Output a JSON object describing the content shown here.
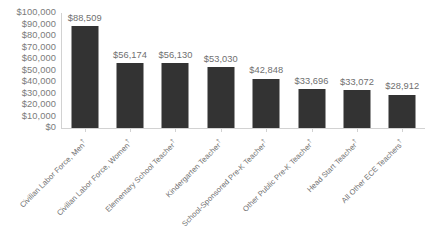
{
  "chart_data": {
    "type": "bar",
    "title": "",
    "subtitle": "",
    "xlabel": "",
    "ylabel": "",
    "ylim": [
      0,
      100000
    ],
    "grid": false,
    "legend": "none",
    "orientation": "vertical",
    "bar_color": "#333333",
    "axis_color": "#d2d2d2",
    "label_color": "#6f6f6f",
    "background_color": "#ffffff",
    "value_prefix": "$",
    "categories": [
      "Civilian Labor Force, Men†",
      "Civilian Labor Force, Women†",
      "Elementary School Teacher†",
      "Kindergarten Teacher†",
      "School-Sponsored Pre-K Teacher†",
      "Other Public Pre-K Teacher†",
      "Head Start Teacher†",
      "All Other ECE Teachers†"
    ],
    "values": [
      88509,
      56174,
      56130,
      53030,
      42848,
      33696,
      33072,
      28912
    ],
    "value_labels": [
      "$88,509",
      "$56,174",
      "$56,130",
      "$53,030",
      "$42,848",
      "$33,696",
      "$33,072",
      "$28,912"
    ],
    "ytick_values": [
      100000,
      90000,
      80000,
      70000,
      60000,
      50000,
      40000,
      30000,
      20000,
      10000,
      0
    ],
    "ytick_labels": [
      "$100,000",
      "$90,000",
      "$80,000",
      "$70,000",
      "$60,000",
      "$50,000",
      "$40,000",
      "$30,000",
      "$20,000",
      "$10,000",
      "$0"
    ]
  }
}
